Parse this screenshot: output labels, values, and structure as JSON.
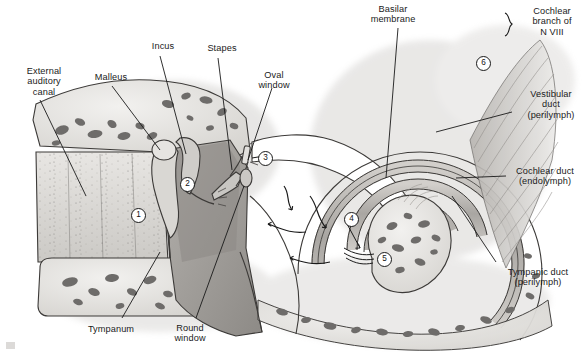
{
  "figure": {
    "background_color": "#ffffff",
    "ink_color": "#1a1a1a",
    "width": 586,
    "height": 352
  },
  "labels": [
    {
      "id": "external-auditory-canal",
      "text": "External\nauditory\ncanal",
      "align": "center",
      "x": 8,
      "y": 66,
      "w": 72
    },
    {
      "id": "malleus",
      "text": "Malleus",
      "align": "center",
      "x": 82,
      "y": 72,
      "w": 58
    },
    {
      "id": "incus",
      "text": "Incus",
      "align": "center",
      "x": 140,
      "y": 41,
      "w": 46
    },
    {
      "id": "stapes",
      "text": "Stapes",
      "align": "center",
      "x": 197,
      "y": 43,
      "w": 50
    },
    {
      "id": "oval-window",
      "text": "Oval\nwindow",
      "align": "center",
      "x": 248,
      "y": 70,
      "w": 52
    },
    {
      "id": "basilar-membrane",
      "text": "Basilar\nmembrane",
      "align": "center",
      "x": 357,
      "y": 4,
      "w": 72
    },
    {
      "id": "cochlear-branch-n-viii",
      "text": "Cochlear\nbranch of\nN VIII",
      "align": "center",
      "x": 519,
      "y": 6,
      "w": 66
    },
    {
      "id": "vestibular-duct",
      "text": "Vestibular\nduct\n(perilymph)",
      "align": "center",
      "x": 516,
      "y": 89,
      "w": 70
    },
    {
      "id": "cochlear-duct",
      "text": "Cochlear duct\n(endolymph)",
      "align": "center",
      "x": 509,
      "y": 166,
      "w": 77
    },
    {
      "id": "tympanic-duct",
      "text": "Tympanic duct\n(perilymph)",
      "align": "center",
      "x": 496,
      "y": 267,
      "w": 84
    },
    {
      "id": "tympanum",
      "text": "Tympanum",
      "align": "center",
      "x": 76,
      "y": 324,
      "w": 70
    },
    {
      "id": "round-window",
      "text": "Round\nwindow",
      "align": "center",
      "x": 164,
      "y": 323,
      "w": 52
    }
  ],
  "markers": [
    {
      "id": "marker-1",
      "value": "1",
      "x": 131,
      "y": 208,
      "meaning": "external auditory canal"
    },
    {
      "id": "marker-2",
      "value": "2",
      "x": 180,
      "y": 177,
      "meaning": "middle ear cavity"
    },
    {
      "id": "marker-3",
      "value": "3",
      "x": 258,
      "y": 151,
      "meaning": "oval window / stapes footplate"
    },
    {
      "id": "marker-4",
      "value": "4",
      "x": 344,
      "y": 212,
      "meaning": "cochlear duct apex region"
    },
    {
      "id": "marker-5",
      "value": "5",
      "x": 377,
      "y": 252,
      "meaning": "round window membrane"
    },
    {
      "id": "marker-6",
      "value": "6",
      "x": 476,
      "y": 56,
      "meaning": "cochlear nerve fibers"
    }
  ],
  "palette": {
    "paper": "#ffffff",
    "ink": "#1a1a1a",
    "bone_fill": "#e4e2df",
    "bone_blob": "#6e6c6a",
    "duct_fill": "#b9b6b2",
    "canal_fill": "#d9d7d3",
    "tissue_dark": "#9b9894",
    "tissue_mid": "#c3c0bc",
    "nerve_fill": "#cfcdc9"
  },
  "flow_arrows": {
    "count": 4,
    "description": "wavy sound-pressure wave arrows traveling up the vestibular duct and back along the tympanic duct"
  }
}
